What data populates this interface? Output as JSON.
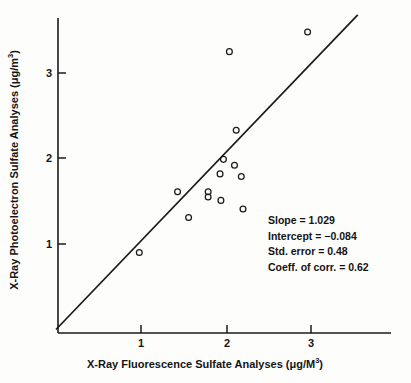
{
  "chart_data": {
    "type": "scatter",
    "title": "",
    "xlabel": "X-Ray Fluorescence Sulfate Analyses (μg/M³)",
    "ylabel": "X-Ray Photoelectron Sulfate Analyses (μg/m³)",
    "xlabel_parts": {
      "text": "X-Ray Fluorescence Sulfate Analyses (μg/M",
      "sup": "3",
      "tail": ")"
    },
    "ylabel_parts": {
      "text": "X-Ray Photoelectron Sulfate Analyses (μg/m",
      "sup": "3",
      "tail": ")"
    },
    "xlim": [
      0,
      3.575
    ],
    "ylim": [
      0,
      3.7
    ],
    "xticks": [
      1,
      2,
      3
    ],
    "yticks": [
      1,
      2,
      3
    ],
    "xtick_labels": [
      "1",
      "2",
      "3"
    ],
    "ytick_labels": [
      "1",
      "2",
      "3"
    ],
    "grid": false,
    "legend": "none",
    "series": [
      {
        "name": "samples",
        "marker": "open-circle",
        "color": "#1a1a1a",
        "points": [
          {
            "x": 0.98,
            "y": 0.9
          },
          {
            "x": 1.43,
            "y": 1.61
          },
          {
            "x": 1.56,
            "y": 1.31
          },
          {
            "x": 1.79,
            "y": 1.61
          },
          {
            "x": 1.79,
            "y": 1.55
          },
          {
            "x": 1.93,
            "y": 1.82
          },
          {
            "x": 1.94,
            "y": 1.51
          },
          {
            "x": 1.97,
            "y": 1.99
          },
          {
            "x": 2.04,
            "y": 3.25
          },
          {
            "x": 2.1,
            "y": 1.92
          },
          {
            "x": 2.12,
            "y": 2.33
          },
          {
            "x": 2.18,
            "y": 1.79
          },
          {
            "x": 2.2,
            "y": 1.41
          },
          {
            "x": 2.96,
            "y": 3.48
          }
        ]
      }
    ],
    "reference_line": {
      "name": "fit-line",
      "from": {
        "x": 0.0,
        "y": 0.0
      },
      "to": {
        "x": 3.55,
        "y": 3.68
      },
      "color": "#1a1a1a"
    },
    "annotations": {
      "slope_label": "Slope = 1.029",
      "intercept_label": "Intercept = −0.084",
      "std_error_label": "Std. error = 0.48",
      "coeff_corr_label": "Coeff. of corr. = 0.62",
      "slope_value": 1.029,
      "intercept_value": -0.084,
      "std_error_value": 0.48,
      "coeff_corr_value": 0.62
    }
  },
  "colors": {
    "ink": "#1a1a1a",
    "background": "#fdfdfc"
  }
}
